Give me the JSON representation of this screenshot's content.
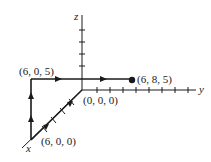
{
  "diagram": {
    "axes": {
      "x_label": "x",
      "y_label": "y",
      "z_label": "z"
    },
    "points": [
      {
        "id": "origin",
        "label": "(0, 0, 0)",
        "coords": [
          0,
          0,
          0
        ]
      },
      {
        "id": "p1",
        "label": "(6, 0, 0)",
        "coords": [
          6,
          0,
          0
        ]
      },
      {
        "id": "p2",
        "label": "(6, 0, 5)",
        "coords": [
          6,
          0,
          5
        ]
      },
      {
        "id": "p3",
        "label": "(6, 8, 5)",
        "coords": [
          6,
          8,
          5
        ]
      }
    ],
    "path": [
      "(0, 0, 0)",
      "(6, 0, 0)",
      "(6, 0, 5)",
      "(6, 8, 5)"
    ],
    "colors": {
      "line": "#1a1a1a",
      "background": "#ffffff"
    }
  }
}
